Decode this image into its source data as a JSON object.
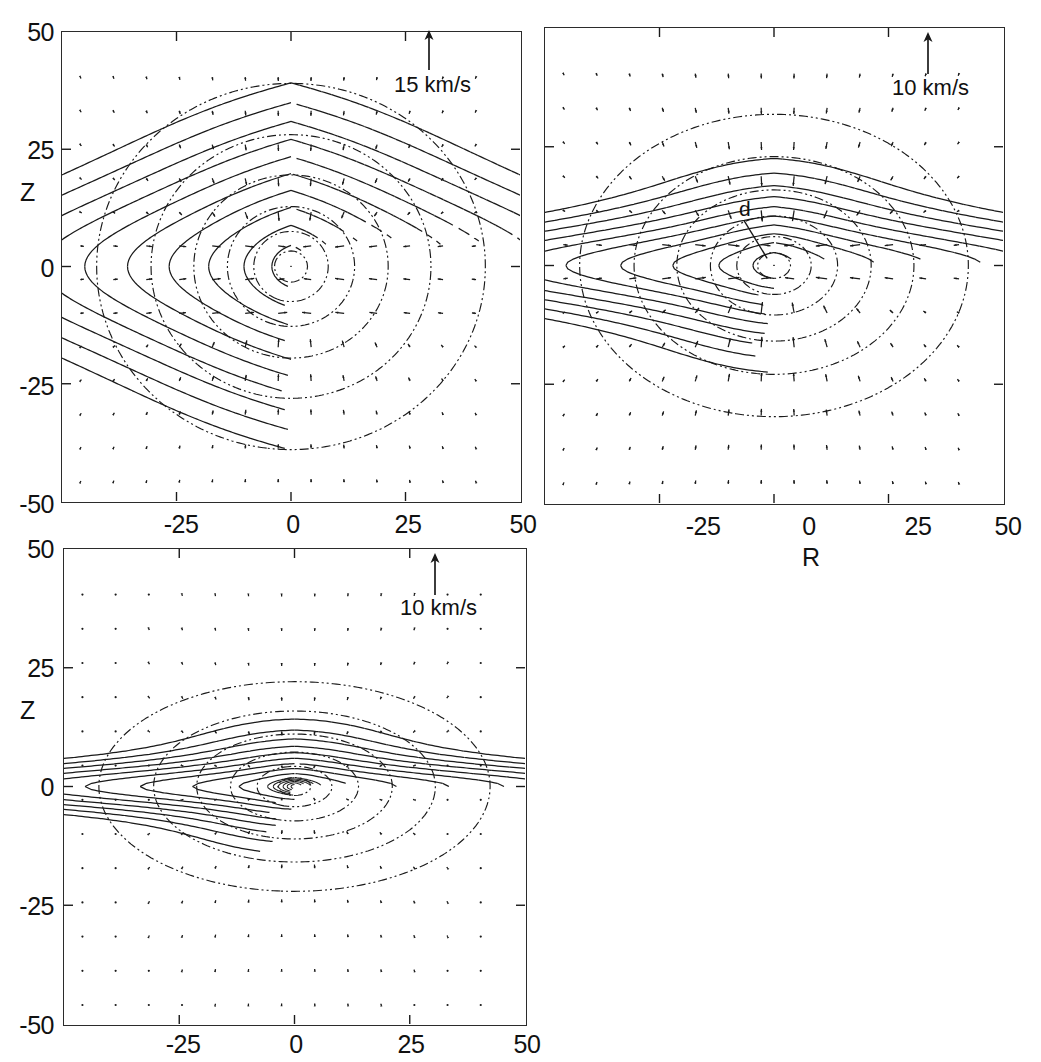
{
  "figure": {
    "type": "multi-panel-contour-vector-field",
    "panel_count": 3,
    "background": "#ffffff",
    "line_color": "#1a1a1a"
  },
  "axes": {
    "x_label": "R",
    "y_label": "Z",
    "x_ticks": [
      "-50",
      "-25",
      "0",
      "25",
      "50"
    ],
    "x_tick_values": [
      -50,
      -25,
      0,
      25,
      50
    ],
    "y_ticks": [
      "50",
      "25",
      "0",
      "-25",
      "-50"
    ],
    "y_tick_values": [
      50,
      25,
      0,
      -25,
      -50
    ],
    "xlim": [
      -50,
      50
    ],
    "ylim": [
      -50,
      50
    ]
  },
  "panels": [
    {
      "id": "panel-top-left",
      "legend_label": "15 km/s",
      "legend_value": 15,
      "legend_units": "km/s",
      "show_y_label": true,
      "show_x_ticks": true,
      "show_x_label": false,
      "y_label": "Z",
      "morphology": "round-spheroidal",
      "disk_scale_height": 9.0,
      "disk_scale_length": 26.0,
      "halo_flattening": 0.92,
      "n_solid_contours": 14,
      "n_dashdot_contours": 9,
      "arrow_scale": 1.0
    },
    {
      "id": "panel-top-right",
      "legend_label": "10 km/s",
      "legend_value": 10,
      "legend_units": "km/s",
      "show_y_label": false,
      "show_x_ticks": true,
      "show_x_label": true,
      "x_label": "R",
      "annotation": "d",
      "morphology": "flattened-disk-plus-round-halo",
      "disk_scale_height": 4.2,
      "disk_scale_length": 34.0,
      "halo_flattening": 0.75,
      "n_solid_contours": 12,
      "n_dashdot_contours": 7,
      "arrow_scale": 1.25
    },
    {
      "id": "panel-bottom-left",
      "legend_label": "10 km/s",
      "legend_value": 10,
      "legend_units": "km/s",
      "show_y_label": true,
      "show_x_ticks": true,
      "show_x_label": false,
      "y_label": "Z",
      "morphology": "thin-disk-plus-compact-halo",
      "disk_scale_height": 2.2,
      "disk_scale_length": 34.0,
      "halo_flattening": 0.52,
      "n_solid_contours": 9,
      "n_dashdot_contours": 6,
      "arrow_scale": 0.45
    }
  ],
  "chart_data": {
    "type": "contour-quiver",
    "title": "",
    "xlabel": "R",
    "ylabel": "Z",
    "xlim": [
      -50,
      50
    ],
    "ylim": [
      -50,
      50
    ],
    "grid": false,
    "legend": "arrow-scale-bar",
    "series": [
      {
        "name": "density contours (solid)",
        "linestyle": "solid",
        "description": "nested closed iso-density contours centred on origin"
      },
      {
        "name": "auxiliary contours (dash-dot)",
        "linestyle": "dashdot",
        "description": "nested closed iso-potential / halo contours"
      },
      {
        "name": "velocity field",
        "style": "arrows",
        "description": "poloidal velocity vectors sampled on a grid"
      }
    ],
    "panel_legends": [
      "15 km/s",
      "10 km/s",
      "10 km/s"
    ],
    "annotations": [
      {
        "panel": 2,
        "text": "d",
        "x": -7,
        "y": 10
      }
    ]
  }
}
